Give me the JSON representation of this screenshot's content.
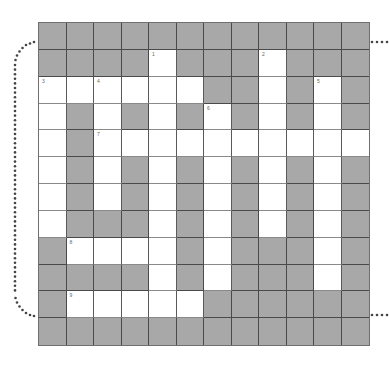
{
  "puzzle": {
    "rows": 12,
    "cols": 12,
    "colors": {
      "block": "#a8a8a8",
      "open": "#ffffff",
      "line": "#4a4a4a",
      "dots": "#444444"
    },
    "grid": [
      "############",
      "####.###.###",
      "......##.#.#",
      ".#.#.#.#.#.#",
      ".#..........",
      ".#.#.#.#.#.#",
      ".#.#.#.#.#.#",
      ".###.#.#.#.#",
      "#....#.###.#",
      "####.#.###.#",
      "#.....######",
      "############"
    ],
    "numbers": [
      {
        "row": 1,
        "col": 4,
        "label": "1"
      },
      {
        "row": 1,
        "col": 8,
        "label": "2"
      },
      {
        "row": 2,
        "col": 0,
        "label": "3"
      },
      {
        "row": 2,
        "col": 2,
        "label": "4"
      },
      {
        "row": 2,
        "col": 10,
        "label": "5"
      },
      {
        "row": 3,
        "col": 6,
        "label": "6"
      },
      {
        "row": 4,
        "col": 2,
        "label": "7"
      },
      {
        "row": 8,
        "col": 1,
        "label": "8"
      },
      {
        "row": 10,
        "col": 1,
        "label": "9"
      }
    ]
  }
}
